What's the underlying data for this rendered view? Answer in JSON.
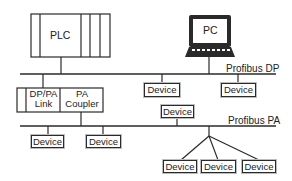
{
  "diagram": {
    "title": "",
    "colors": {
      "line": "#2a2a2a",
      "background": "#ffffff",
      "screen": "#ffffff",
      "keyboard": "#2a2a2a"
    },
    "nodes": {
      "plc": {
        "label": "PLC"
      },
      "pc": {
        "label": "PC"
      },
      "link": {
        "left_label": "DP/PA Link",
        "left_line1": "DP/PA",
        "left_line2": "Link",
        "right_label": "PA Coupler",
        "right_line1": "PA",
        "right_line2": "Coupler"
      },
      "dp_devices": [
        {
          "label": "Device"
        },
        {
          "label": "Device"
        }
      ],
      "pa_device_above": {
        "label": "Device"
      },
      "pa_devices": [
        {
          "label": "Device"
        },
        {
          "label": "Device"
        }
      ],
      "pa_branch_devices": [
        {
          "label": "Device"
        },
        {
          "label": "Device"
        },
        {
          "label": "Device"
        }
      ]
    },
    "buses": {
      "dp": {
        "label": "Profibus DP"
      },
      "pa": {
        "label": "Profibus PA"
      }
    },
    "edges": [
      {
        "from": "PLC",
        "to": "Profibus DP"
      },
      {
        "from": "PC",
        "to": "Profibus DP"
      },
      {
        "from": "Profibus DP",
        "to": "DP/PA Link"
      },
      {
        "from": "Profibus DP",
        "to": "Device"
      },
      {
        "from": "Profibus DP",
        "to": "Device"
      },
      {
        "from": "PA Coupler",
        "to": "Profibus PA"
      },
      {
        "from": "Profibus PA",
        "to": "Device"
      },
      {
        "from": "Profibus PA",
        "to": "Device"
      },
      {
        "from": "Profibus PA",
        "to": "Device"
      },
      {
        "from": "Profibus PA",
        "to": "Device (x3 branch)"
      }
    ]
  }
}
